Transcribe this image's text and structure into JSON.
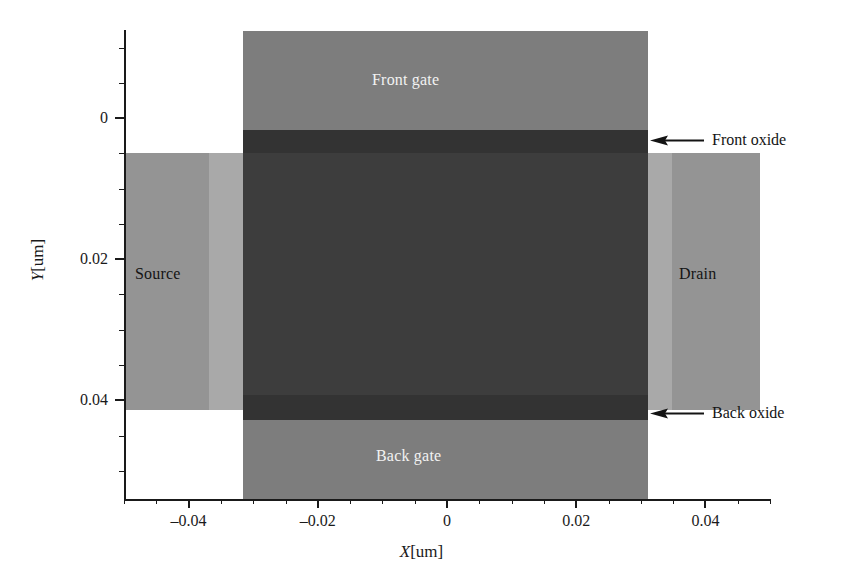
{
  "chart_data": {
    "type": "diagram",
    "title": "",
    "xlabel": "X[um]",
    "ylabel": "Y[um]",
    "xlim": [
      -0.05,
      0.05
    ],
    "ylim": [
      0.054,
      -0.0125
    ],
    "y_axis_inverted": true,
    "grid": false,
    "legend": null,
    "x_ticks": [
      {
        "value": -0.04,
        "label": "–0.04"
      },
      {
        "value": -0.02,
        "label": "–0.02"
      },
      {
        "value": 0,
        "label": "0"
      },
      {
        "value": 0.02,
        "label": "0.02"
      },
      {
        "value": 0.04,
        "label": "0.04"
      }
    ],
    "y_ticks": [
      {
        "value": 0,
        "label": "0"
      },
      {
        "value": 0.02,
        "label": "0.02"
      },
      {
        "value": 0.04,
        "label": "0.04"
      }
    ],
    "x_minor_tick_step": 0.005,
    "y_minor_tick_step": 0.005,
    "regions": [
      {
        "name": "front-gate",
        "label": "Front gate",
        "x_range": [
          -0.032,
          0.032
        ],
        "y_range": [
          -0.0125,
          -0.0015
        ],
        "color": "#7d7d7d",
        "text_color": "#f2f2f2"
      },
      {
        "name": "front-oxide",
        "label": "Front oxide",
        "x_range": [
          -0.032,
          0.032
        ],
        "y_range": [
          -0.0015,
          0.0
        ],
        "color": "#333333",
        "text_color": "#141414"
      },
      {
        "name": "channel",
        "label": "",
        "x_range": [
          -0.032,
          0.032
        ],
        "y_range": [
          0.0,
          0.0365
        ],
        "color": "#3d3d3d",
        "text_color": "#f2f2f2"
      },
      {
        "name": "back-oxide",
        "label": "Back oxide",
        "x_range": [
          -0.032,
          0.032
        ],
        "y_range": [
          0.0365,
          0.04
        ],
        "color": "#333333",
        "text_color": "#141414"
      },
      {
        "name": "back-gate",
        "label": "Back gate",
        "x_range": [
          -0.032,
          0.032
        ],
        "y_range": [
          0.04,
          0.0525
        ],
        "color": "#7d7d7d",
        "text_color": "#f2f2f2"
      },
      {
        "name": "source",
        "label": "Source",
        "x_range": [
          -0.05,
          -0.032
        ],
        "y_range": [
          0.0,
          0.04
        ],
        "color": "#949494",
        "text_color": "#141414"
      },
      {
        "name": "drain",
        "label": "Drain",
        "x_range": [
          0.032,
          0.05
        ],
        "y_range": [
          0.0,
          0.04
        ],
        "color": "#949494",
        "text_color": "#141414"
      }
    ],
    "annotations": [
      {
        "name": "front-oxide-callout",
        "text": "Front oxide",
        "points_to": "front-oxide",
        "arrow": "left"
      },
      {
        "name": "back-oxide-callout",
        "text": "Back oxide",
        "points_to": "back-oxide",
        "arrow": "left"
      }
    ]
  },
  "axes": {
    "x_title_var": "X",
    "x_title_unit": "[um]",
    "y_title_var": "Y",
    "y_title_unit": "[um]"
  },
  "labels": {
    "front_gate": "Front gate",
    "back_gate": "Back gate",
    "source": "Source",
    "drain": "Drain",
    "front_oxide": "Front oxide",
    "back_oxide": "Back oxide"
  },
  "colors": {
    "gate": "#7d7d7d",
    "oxide": "#333333",
    "channel": "#3d3d3d",
    "contact": "#949494",
    "contact_light": "#a9a9a9",
    "axis": "#1a1a1a",
    "background": "#ffffff"
  }
}
